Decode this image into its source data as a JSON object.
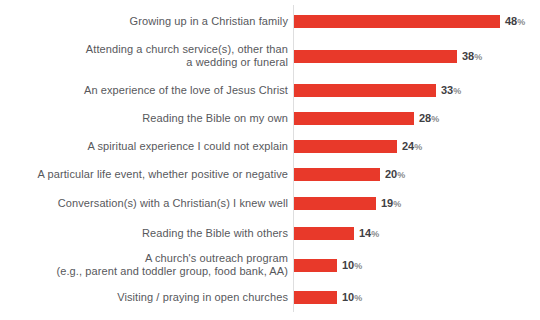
{
  "chart_data": {
    "type": "bar",
    "orientation": "horizontal",
    "unit": "%",
    "xlim": [
      0,
      50
    ],
    "bar_color": "#e8392a",
    "label_color": "#57585c",
    "value_color": "#3f4043",
    "baseline_color": "#dededf",
    "categories": [
      "Growing up in a Christian family",
      "Attending a church service(s), other than a wedding or funeral",
      "An experience of the love of Jesus Christ",
      "Reading the Bible on my own",
      "A spiritual experience I could not explain",
      "A particular life event, whether positive or negative",
      "Conversation(s) with a Christian(s) I knew well",
      "Reading the Bible with others",
      "A church's outreach program (e.g., parent and toddler group, food bank, AA)",
      "Visiting / praying in open churches"
    ],
    "values": [
      48,
      38,
      33,
      28,
      24,
      20,
      19,
      14,
      10,
      10
    ],
    "rows": [
      {
        "label_line1": "Growing up in a Christian family",
        "value": 48,
        "value_label": "48"
      },
      {
        "label_line1": "Attending a church service(s), other than",
        "label_line2": "a wedding or funeral",
        "value": 38,
        "value_label": "38"
      },
      {
        "label_line1": "An experience of the love of Jesus Christ",
        "value": 33,
        "value_label": "33"
      },
      {
        "label_line1": "Reading the Bible on my own",
        "value": 28,
        "value_label": "28"
      },
      {
        "label_line1": "A spiritual experience I could not explain",
        "value": 24,
        "value_label": "24"
      },
      {
        "label_line1": "A particular life event, whether positive or negative",
        "value": 20,
        "value_label": "20"
      },
      {
        "label_line1": "Conversation(s) with a Christian(s) I knew well",
        "value": 19,
        "value_label": "19"
      },
      {
        "label_line1": "Reading the Bible with others",
        "value": 14,
        "value_label": "14"
      },
      {
        "label_line1": "A church's outreach program",
        "label_line2": "(e.g., parent and toddler group, food bank, AA)",
        "value": 10,
        "value_label": "10"
      },
      {
        "label_line1": "Visiting / praying in open churches",
        "value": 10,
        "value_label": "10"
      }
    ]
  }
}
